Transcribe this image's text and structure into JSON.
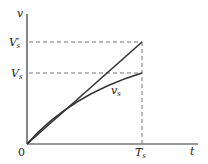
{
  "diagram": {
    "axis_y_label": "v",
    "axis_x_label": "t",
    "origin_label": "0",
    "levels": [
      {
        "main": "V",
        "prime": "′",
        "sub": "s"
      },
      {
        "main": "V",
        "prime": "",
        "sub": "s"
      }
    ],
    "time_marker": {
      "main": "T",
      "sub": "s"
    },
    "curve_label": {
      "main": "v",
      "sub": "s"
    },
    "colors": {
      "line": "#333333",
      "dash": "#777777"
    }
  }
}
